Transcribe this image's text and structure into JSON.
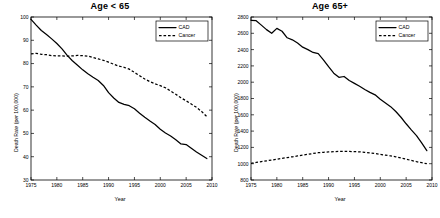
{
  "figure": {
    "xlabel": "Year",
    "ylabel": "Death Rate (per 100,000)",
    "legend": {
      "cad_label": "CAD",
      "cancer_label": "Cancer",
      "position": "top-right"
    }
  },
  "chart_data": [
    {
      "type": "line",
      "title": "Age < 65",
      "xlabel": "Year",
      "ylabel": "Death Rate (per 100,000)",
      "xlim": [
        1975,
        2010
      ],
      "ylim": [
        30,
        100
      ],
      "xticks": [
        1975,
        1980,
        1985,
        1990,
        1995,
        2000,
        2005,
        2010
      ],
      "yticks": [
        30,
        40,
        50,
        60,
        70,
        80,
        90,
        100
      ],
      "grid": false,
      "legend": [
        "CAD",
        "Cancer"
      ],
      "x": [
        1975,
        1976,
        1977,
        1978,
        1979,
        1980,
        1981,
        1982,
        1983,
        1984,
        1985,
        1986,
        1987,
        1988,
        1989,
        1990,
        1991,
        1992,
        1993,
        1994,
        1995,
        1996,
        1997,
        1998,
        1999,
        2000,
        2001,
        2002,
        2003,
        2004,
        2005,
        2006,
        2007,
        2008,
        2009
      ],
      "series": [
        {
          "name": "CAD",
          "style": "solid",
          "values": [
            99.0,
            96.5,
            94.2,
            92.5,
            90.6,
            88.6,
            86.3,
            83.5,
            81.2,
            79.3,
            77.3,
            75.6,
            74.1,
            72.7,
            70.6,
            67.5,
            65.2,
            63.3,
            62.5,
            61.9,
            60.6,
            58.7,
            56.9,
            55.3,
            53.8,
            51.8,
            50.2,
            48.9,
            47.3,
            45.5,
            45.2,
            43.6,
            42.0,
            40.6,
            39.2
          ]
        },
        {
          "name": "Cancer",
          "style": "dashed",
          "values": [
            84.2,
            84.4,
            84.0,
            83.8,
            83.4,
            83.3,
            83.3,
            83.2,
            83.3,
            83.5,
            83.4,
            83.2,
            82.6,
            82.0,
            81.4,
            80.6,
            79.7,
            78.9,
            78.4,
            77.6,
            76.2,
            74.8,
            73.4,
            72.2,
            71.3,
            70.5,
            69.6,
            68.2,
            66.8,
            65.3,
            64.0,
            62.6,
            61.2,
            59.4,
            57.2
          ]
        }
      ]
    },
    {
      "type": "line",
      "title": "Age 65+",
      "xlabel": "Year",
      "ylabel": "Death Rate (per 100,000)",
      "xlim": [
        1975,
        2010
      ],
      "ylim": [
        800,
        2800
      ],
      "xticks": [
        1975,
        1980,
        1985,
        1990,
        1995,
        2000,
        2005,
        2010
      ],
      "yticks": [
        800,
        1000,
        1200,
        1400,
        1600,
        1800,
        2000,
        2200,
        2400,
        2600,
        2800
      ],
      "grid": false,
      "legend": [
        "CAD",
        "Cancer"
      ],
      "x": [
        1975,
        1976,
        1977,
        1978,
        1979,
        1980,
        1981,
        1982,
        1983,
        1984,
        1985,
        1986,
        1987,
        1988,
        1989,
        1990,
        1991,
        1992,
        1993,
        1994,
        1995,
        1996,
        1997,
        1998,
        1999,
        2000,
        2001,
        2002,
        2003,
        2004,
        2005,
        2006,
        2007,
        2008,
        2009
      ],
      "series": [
        {
          "name": "CAD",
          "style": "solid",
          "values": [
            2760,
            2755,
            2700,
            2645,
            2600,
            2660,
            2625,
            2545,
            2520,
            2480,
            2430,
            2400,
            2365,
            2350,
            2275,
            2190,
            2110,
            2060,
            2070,
            2020,
            1985,
            1950,
            1910,
            1875,
            1845,
            1790,
            1745,
            1700,
            1640,
            1570,
            1490,
            1415,
            1345,
            1255,
            1160
          ]
        },
        {
          "name": "Cancer",
          "style": "dashed",
          "values": [
            1005,
            1015,
            1025,
            1035,
            1045,
            1055,
            1065,
            1075,
            1085,
            1095,
            1105,
            1115,
            1125,
            1135,
            1140,
            1145,
            1148,
            1150,
            1152,
            1150,
            1148,
            1145,
            1140,
            1132,
            1125,
            1115,
            1105,
            1095,
            1085,
            1070,
            1055,
            1040,
            1025,
            1012,
            1000
          ]
        }
      ]
    }
  ]
}
